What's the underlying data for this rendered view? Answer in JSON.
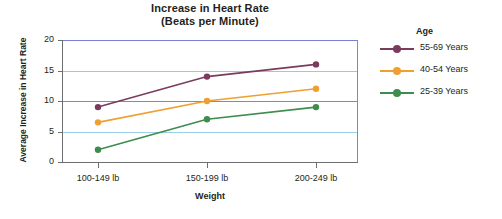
{
  "chart_data": {
    "type": "line",
    "title": "Increase in Heart Rate",
    "subtitle": "(Beats per Minute)",
    "xlabel": "Weight",
    "ylabel": "Average Increase in Heart Rate",
    "categories": [
      "100-149 lb",
      "150-199 lb",
      "200-249 lb"
    ],
    "ylim": [
      0,
      20
    ],
    "yticks": [
      "0",
      "5",
      "10",
      "15",
      "20"
    ],
    "ytick_values": [
      0,
      5,
      10,
      15,
      20
    ],
    "grid": true,
    "gridline_colors": {
      "20": "#7a7fd0",
      "15": "#9ed2a4",
      "10": "#8a8c8e",
      "5": "#9ecfe8"
    },
    "legend_position": "right",
    "legend_title": "Age",
    "series": [
      {
        "name": "55-69 Years",
        "color": "#7b3b5e",
        "values": [
          9,
          14,
          16
        ]
      },
      {
        "name": "40-54 Years",
        "color": "#efa031",
        "values": [
          6.5,
          10,
          12
        ]
      },
      {
        "name": "25-39 Years",
        "color": "#3e8c4e",
        "values": [
          2,
          7,
          9
        ]
      }
    ]
  },
  "chart": {
    "title": "Increase in Heart Rate",
    "subtitle": "(Beats per Minute)",
    "xlabel": "Weight",
    "ylabel": "Average Increase in Heart Rate"
  },
  "legend": {
    "title": "Age",
    "items": [
      {
        "label": "55-69 Years"
      },
      {
        "label": "40-54 Years"
      },
      {
        "label": "25-39 Years"
      }
    ]
  }
}
